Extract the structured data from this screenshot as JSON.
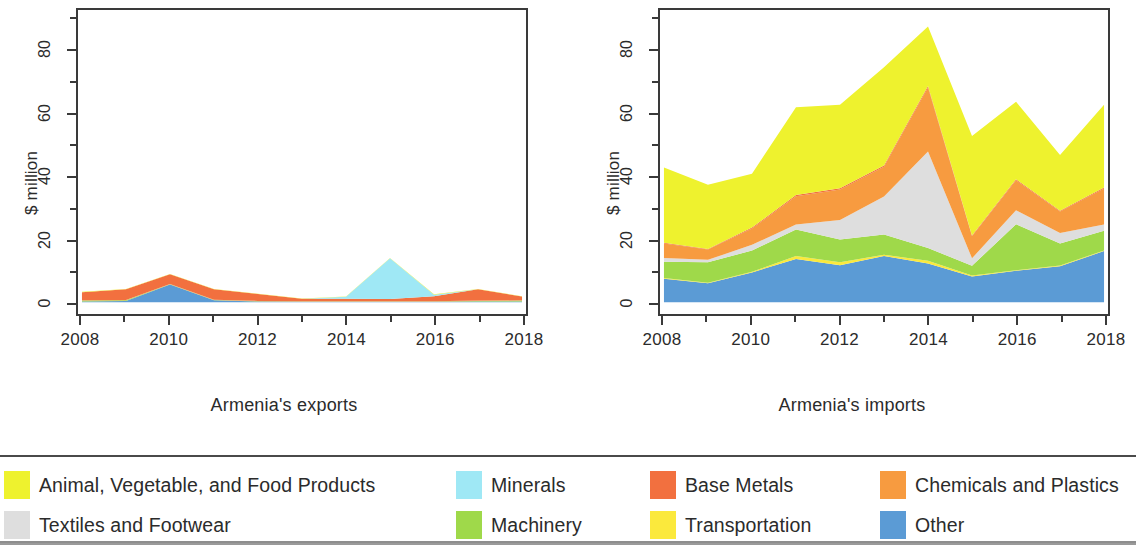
{
  "figure": {
    "y_axis_title": "$ million",
    "x_tick_labels": [
      "2008",
      "2010",
      "2012",
      "2014",
      "2016",
      "2018"
    ],
    "y_tick_labels": [
      "0",
      "20",
      "40",
      "60",
      "80"
    ]
  },
  "panels": [
    {
      "caption": "Armenia's exports"
    },
    {
      "caption": "Armenia's imports"
    }
  ],
  "legend": {
    "items": [
      {
        "label": "Animal, Vegetable, and Food Products",
        "color": "#eef22e",
        "icon": "legend-swatch-animal-vegetable-food"
      },
      {
        "label": "Minerals",
        "color": "#9fe8f5",
        "icon": "legend-swatch-minerals"
      },
      {
        "label": "Base Metals",
        "color": "#f2703f",
        "icon": "legend-swatch-base-metals"
      },
      {
        "label": "Chemicals and Plastics",
        "color": "#f79b40",
        "icon": "legend-swatch-chemicals-plastics"
      },
      {
        "label": "Textiles and Footwear",
        "color": "#dedede",
        "icon": "legend-swatch-textiles-footwear"
      },
      {
        "label": "Machinery",
        "color": "#9fd94a",
        "icon": "legend-swatch-machinery"
      },
      {
        "label": "Transportation",
        "color": "#fbe93c",
        "icon": "legend-swatch-transportation"
      },
      {
        "label": "Other",
        "color": "#5b9bd5",
        "icon": "legend-swatch-other"
      }
    ]
  },
  "chart_data": [
    {
      "type": "area",
      "title": "Armenia's exports",
      "stacked": true,
      "xlabel": "",
      "ylabel": "$ million",
      "xlim": [
        2008,
        2018
      ],
      "ylim": [
        0,
        92
      ],
      "yticks": [
        0,
        20,
        40,
        60,
        80
      ],
      "grid": false,
      "legend_position": "bottom-shared",
      "x": [
        2008,
        2009,
        2010,
        2011,
        2012,
        2013,
        2014,
        2015,
        2016,
        2017,
        2018
      ],
      "series": [
        {
          "name": "Other",
          "color": "#5b9bd5",
          "values": [
            0.2,
            0.4,
            5.6,
            0.6,
            0.2,
            0.1,
            0.1,
            0.1,
            0.1,
            0.2,
            0.2
          ]
        },
        {
          "name": "Transportation",
          "color": "#fbe93c",
          "values": [
            0.0,
            0.0,
            0.0,
            0.0,
            0.0,
            0.0,
            0.0,
            0.0,
            0.0,
            0.0,
            0.0
          ]
        },
        {
          "name": "Machinery",
          "color": "#9fd94a",
          "values": [
            0.3,
            0.2,
            0.1,
            0.1,
            0.1,
            0.1,
            0.1,
            0.1,
            0.1,
            0.2,
            0.3
          ]
        },
        {
          "name": "Textiles and Footwear",
          "color": "#dedede",
          "values": [
            0.0,
            0.0,
            0.0,
            0.0,
            0.0,
            0.0,
            0.0,
            0.0,
            0.0,
            0.0,
            0.0
          ]
        },
        {
          "name": "Chemicals and Plastics",
          "color": "#f79b40",
          "values": [
            0.1,
            0.1,
            0.1,
            0.1,
            0.1,
            0.1,
            0.1,
            0.1,
            0.1,
            0.1,
            0.1
          ]
        },
        {
          "name": "Base Metals",
          "color": "#f2703f",
          "values": [
            2.6,
            3.4,
            3.1,
            3.3,
            2.2,
            0.8,
            0.8,
            0.7,
            1.6,
            3.6,
            1.2
          ]
        },
        {
          "name": "Minerals",
          "color": "#9fe8f5",
          "values": [
            0.0,
            0.0,
            0.0,
            0.0,
            0.0,
            0.0,
            0.6,
            13.0,
            0.5,
            0.0,
            0.0
          ]
        },
        {
          "name": "Animal, Vegetable, and Food Products",
          "color": "#eef22e",
          "values": [
            0.1,
            0.1,
            0.1,
            0.1,
            0.1,
            0.1,
            0.1,
            0.1,
            0.1,
            0.1,
            0.1
          ]
        }
      ],
      "totals": [
        3.3,
        4.2,
        9.0,
        4.2,
        2.7,
        1.2,
        1.8,
        14.1,
        2.5,
        4.2,
        1.9
      ]
    },
    {
      "type": "area",
      "title": "Armenia's imports",
      "stacked": true,
      "xlabel": "",
      "ylabel": "$ million",
      "xlim": [
        2008,
        2018
      ],
      "ylim": [
        0,
        92
      ],
      "yticks": [
        0,
        20,
        40,
        60,
        80
      ],
      "grid": false,
      "legend_position": "bottom-shared",
      "x": [
        2008,
        2009,
        2010,
        2011,
        2012,
        2013,
        2014,
        2015,
        2016,
        2017,
        2018
      ],
      "series": [
        {
          "name": "Other",
          "color": "#5b9bd5",
          "values": [
            7.5,
            6.0,
            9.5,
            13.8,
            11.8,
            14.7,
            12.3,
            8.2,
            10.0,
            11.5,
            16.3
          ]
        },
        {
          "name": "Transportation",
          "color": "#fbe93c",
          "values": [
            0.2,
            0.2,
            0.2,
            0.9,
            0.9,
            0.4,
            0.9,
            0.3,
            0.2,
            0.2,
            0.2
          ]
        },
        {
          "name": "Machinery",
          "color": "#9fd94a",
          "values": [
            5.2,
            6.5,
            6.8,
            8.5,
            7.3,
            6.5,
            4.1,
            3.1,
            14.7,
            7.0,
            6.3
          ]
        },
        {
          "name": "Textiles and Footwear",
          "color": "#dedede",
          "values": [
            1.2,
            0.8,
            1.8,
            1.6,
            6.2,
            12.1,
            30.8,
            2.4,
            4.4,
            3.4,
            2.0
          ]
        },
        {
          "name": "Chemicals and Plastics",
          "color": "#f79b40",
          "values": [
            4.6,
            3.3,
            5.2,
            9.0,
            9.8,
            9.5,
            20.4,
            7.0,
            9.6,
            6.8,
            11.5
          ]
        },
        {
          "name": "Base Metals",
          "color": "#f2703f",
          "values": [
            0.3,
            0.2,
            0.3,
            0.4,
            0.4,
            0.4,
            0.5,
            0.3,
            0.3,
            0.3,
            0.3
          ]
        },
        {
          "name": "Minerals",
          "color": "#9fe8f5",
          "values": [
            0.0,
            0.0,
            0.0,
            0.0,
            0.0,
            0.0,
            0.0,
            0.0,
            0.0,
            0.0,
            0.0
          ]
        },
        {
          "name": "Animal, Vegetable, and Food Products",
          "color": "#eef22e",
          "values": [
            24.0,
            20.5,
            17.2,
            28.0,
            26.6,
            31.4,
            19.0,
            31.7,
            24.8,
            17.8,
            26.4
          ]
        }
      ],
      "totals": [
        43.0,
        37.5,
        41.0,
        62.2,
        63.0,
        75.0,
        88.0,
        53.0,
        64.0,
        47.0,
        63.0
      ]
    }
  ]
}
